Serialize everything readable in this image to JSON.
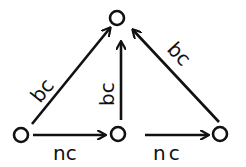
{
  "diagram": {
    "nodes": [
      {
        "id": "top",
        "label": "o"
      },
      {
        "id": "left",
        "label": "o"
      },
      {
        "id": "middle",
        "label": "o"
      },
      {
        "id": "right",
        "label": "o"
      }
    ],
    "edges": [
      {
        "from": "left",
        "to": "top",
        "label": "bc"
      },
      {
        "from": "middle",
        "to": "top",
        "label": "bc"
      },
      {
        "from": "right",
        "to": "top",
        "label": "bc"
      },
      {
        "from": "left",
        "to": "middle",
        "label": "nc"
      },
      {
        "from": "middle",
        "to": "right",
        "label": "nc"
      }
    ]
  }
}
